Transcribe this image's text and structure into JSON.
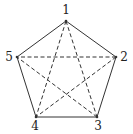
{
  "diagram": {
    "type": "complete-graph-K5-pentagon",
    "vertices": [
      {
        "id": "1",
        "label": "1",
        "x": 66,
        "y": 21,
        "lx": 66,
        "ly": 14
      },
      {
        "id": "2",
        "label": "2",
        "x": 116,
        "y": 57,
        "lx": 124,
        "ly": 61
      },
      {
        "id": "3",
        "label": "3",
        "x": 97,
        "y": 117,
        "lx": 98,
        "ly": 130
      },
      {
        "id": "4",
        "label": "4",
        "x": 36,
        "y": 117,
        "lx": 35,
        "ly": 130
      },
      {
        "id": "5",
        "label": "5",
        "x": 17,
        "y": 57,
        "lx": 9,
        "ly": 61
      }
    ],
    "solid_edges": [
      [
        "1",
        "2"
      ],
      [
        "2",
        "3"
      ],
      [
        "3",
        "4"
      ],
      [
        "4",
        "5"
      ],
      [
        "5",
        "1"
      ]
    ],
    "dashed_edges": [
      [
        "1",
        "3"
      ],
      [
        "1",
        "4"
      ],
      [
        "2",
        "4"
      ],
      [
        "2",
        "5"
      ],
      [
        "3",
        "5"
      ]
    ],
    "colors": {
      "line": "#333333",
      "label": "#222222"
    }
  }
}
